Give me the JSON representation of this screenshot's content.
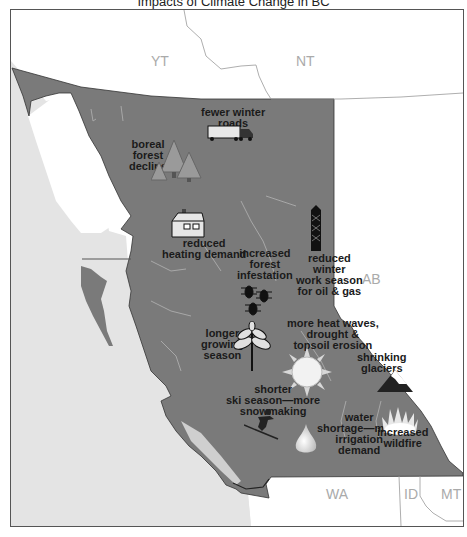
{
  "map": {
    "title_fragment": "Impacts of Climate Change in BC",
    "colors": {
      "province_fill": "#7a7a7a",
      "ocean_fill": "#e4e4e4",
      "land_other": "#ffffff",
      "border_line": "#9a9a9a",
      "river": "#a8a8a8"
    },
    "regions": [
      {
        "id": "yt",
        "label": "YT"
      },
      {
        "id": "nt",
        "label": "NT"
      },
      {
        "id": "ab",
        "label": "AB"
      },
      {
        "id": "wa",
        "label": "WA"
      },
      {
        "id": "id",
        "label": "ID"
      },
      {
        "id": "mt",
        "label": "MT"
      }
    ],
    "impacts": [
      {
        "id": "winter-roads",
        "icon": "truck-icon",
        "lines": [
          "fewer winter",
          "roads"
        ]
      },
      {
        "id": "boreal-forest",
        "icon": "trees-icon",
        "lines": [
          "boreal",
          "forest",
          "decline"
        ]
      },
      {
        "id": "heating",
        "icon": "house-icon",
        "lines": [
          "reduced",
          "heating demand"
        ]
      },
      {
        "id": "infestation",
        "icon": "beetles-icon",
        "lines": [
          "increased",
          "forest",
          "infestation"
        ]
      },
      {
        "id": "oil-gas",
        "icon": "oil-derrick-icon",
        "lines": [
          "reduced",
          "winter",
          "work season",
          "for oil & gas"
        ]
      },
      {
        "id": "growing-season",
        "icon": "leaf-icon",
        "lines": [
          "longer",
          "growing",
          "season"
        ]
      },
      {
        "id": "heat-waves",
        "icon": "sun-icon",
        "lines": [
          "more heat waves,",
          "drought &",
          "topsoil erosion"
        ]
      },
      {
        "id": "glaciers",
        "icon": "mountain-icon",
        "lines": [
          "shrinking",
          "glaciers"
        ]
      },
      {
        "id": "ski",
        "icon": "skier-icon",
        "lines": [
          "shorter",
          "ski season—more",
          "snowmaking"
        ]
      },
      {
        "id": "water",
        "icon": "water-drop-icon",
        "lines": [
          "water",
          "shortage—more",
          "irrigation",
          "demand"
        ]
      },
      {
        "id": "wildfire",
        "icon": "fire-icon",
        "lines": [
          "increased",
          "wildfire"
        ]
      }
    ]
  }
}
